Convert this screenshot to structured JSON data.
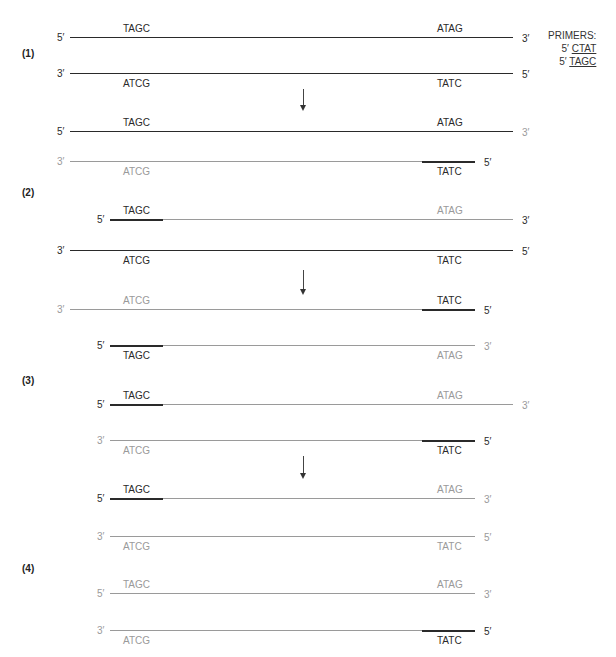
{
  "colors": {
    "dark": "#2a2a2a",
    "light": "#9a9a9a"
  },
  "primers": {
    "title": "PRIMERS:",
    "items": [
      {
        "prime": "5′",
        "seq": "CTAT"
      },
      {
        "prime": "5′",
        "seq": "TAGC"
      }
    ]
  },
  "steps": [
    {
      "label": "(1)",
      "y": 48
    },
    {
      "label": "(2)",
      "y": 187
    },
    {
      "label": "(3)",
      "y": 375
    },
    {
      "label": "(4)",
      "y": 563
    }
  ],
  "arrows": [
    {
      "x": 303,
      "y": 89,
      "h": 17
    },
    {
      "x": 303,
      "y": 270,
      "h": 20
    },
    {
      "x": 303,
      "y": 456,
      "h": 18
    }
  ],
  "strands": [
    {
      "y": 37,
      "x1": 70,
      "x2": 513,
      "left": "5′",
      "right": "3′",
      "base": "dark",
      "leftSeq": "TAGC",
      "rightSeq": "ATAG",
      "seqPos": "above",
      "leftSeqColor": "dark",
      "rightSeqColor": "dark",
      "leftColor": "dark",
      "rightColor": "dark"
    },
    {
      "y": 73,
      "x1": 70,
      "x2": 513,
      "left": "3′",
      "right": "5′",
      "base": "dark",
      "leftSeq": "ATCG",
      "rightSeq": "TATC",
      "seqPos": "below",
      "leftSeqColor": "dark",
      "rightSeqColor": "dark",
      "leftColor": "dark",
      "rightColor": "dark"
    },
    {
      "y": 131,
      "x1": 70,
      "x2": 513,
      "left": "5′",
      "right": "3′",
      "base": "dark",
      "leftSeq": "TAGC",
      "rightSeq": "ATAG",
      "seqPos": "above",
      "leftSeqColor": "dark",
      "rightSeqColor": "dark",
      "leftColor": "dark",
      "rightColor": "light"
    },
    {
      "y": 161,
      "x1": 70,
      "x2": 475,
      "left": "3′",
      "right": "5′",
      "base": "light",
      "primer": "right",
      "leftSeq": "ATCG",
      "rightSeq": "TATC",
      "seqPos": "below",
      "leftSeqColor": "light",
      "rightSeqColor": "dark",
      "leftColor": "light",
      "rightColor": "dark"
    },
    {
      "y": 219,
      "x1": 110,
      "x2": 513,
      "left": "5′",
      "right": "3′",
      "base": "light",
      "primer": "left",
      "leftSeq": "TAGC",
      "rightSeq": "ATAG",
      "seqPos": "above",
      "leftSeqColor": "dark",
      "rightSeqColor": "light",
      "leftColor": "dark",
      "rightColor": "dark"
    },
    {
      "y": 250,
      "x1": 70,
      "x2": 513,
      "left": "3′",
      "right": "5′",
      "base": "dark",
      "leftSeq": "ATCG",
      "rightSeq": "TATC",
      "seqPos": "below",
      "leftSeqColor": "dark",
      "rightSeqColor": "dark",
      "leftColor": "dark",
      "rightColor": "dark"
    },
    {
      "y": 309,
      "x1": 70,
      "x2": 475,
      "left": "3′",
      "right": "5′",
      "base": "light",
      "primer": "right",
      "leftSeq": "ATCG",
      "rightSeq": "TATC",
      "seqPos": "above",
      "leftSeqColor": "light",
      "rightSeqColor": "dark",
      "leftColor": "light",
      "rightColor": "dark"
    },
    {
      "y": 345,
      "x1": 110,
      "x2": 475,
      "left": "5′",
      "right": "3′",
      "base": "light",
      "primer": "left",
      "leftSeq": "TAGC",
      "rightSeq": "ATAG",
      "seqPos": "below",
      "leftSeqColor": "dark",
      "rightSeqColor": "light",
      "leftColor": "dark",
      "rightColor": "light"
    },
    {
      "y": 404,
      "x1": 110,
      "x2": 513,
      "left": "5′",
      "right": "3′",
      "base": "light",
      "primer": "left",
      "leftSeq": "TAGC",
      "rightSeq": "ATAG",
      "seqPos": "above",
      "leftSeqColor": "dark",
      "rightSeqColor": "light",
      "leftColor": "dark",
      "rightColor": "light"
    },
    {
      "y": 440,
      "x1": 110,
      "x2": 475,
      "left": "3′",
      "right": "5′",
      "base": "light",
      "primer": "right",
      "leftSeq": "ATCG",
      "rightSeq": "TATC",
      "seqPos": "below",
      "leftSeqColor": "light",
      "rightSeqColor": "dark",
      "leftColor": "light",
      "rightColor": "dark"
    },
    {
      "y": 498,
      "x1": 110,
      "x2": 475,
      "left": "5′",
      "right": "3′",
      "base": "light",
      "primer": "left",
      "leftSeq": "TAGC",
      "rightSeq": "ATAG",
      "seqPos": "above",
      "leftSeqColor": "dark",
      "rightSeqColor": "light",
      "leftColor": "dark",
      "rightColor": "light"
    },
    {
      "y": 536,
      "x1": 110,
      "x2": 475,
      "left": "3′",
      "right": "5′",
      "base": "light",
      "leftSeq": "ATCG",
      "rightSeq": "TATC",
      "seqPos": "below",
      "leftSeqColor": "light",
      "rightSeqColor": "light",
      "leftColor": "light",
      "rightColor": "light"
    },
    {
      "y": 593,
      "x1": 110,
      "x2": 475,
      "left": "5′",
      "right": "3′",
      "base": "light",
      "leftSeq": "TAGC",
      "rightSeq": "ATAG",
      "seqPos": "above",
      "leftSeqColor": "light",
      "rightSeqColor": "light",
      "leftColor": "light",
      "rightColor": "light"
    },
    {
      "y": 630,
      "x1": 110,
      "x2": 475,
      "left": "3′",
      "right": "5′",
      "base": "light",
      "primer": "right",
      "leftSeq": "ATCG",
      "rightSeq": "TATC",
      "seqPos": "below",
      "leftSeqColor": "light",
      "rightSeqColor": "dark",
      "leftColor": "light",
      "rightColor": "dark"
    }
  ]
}
